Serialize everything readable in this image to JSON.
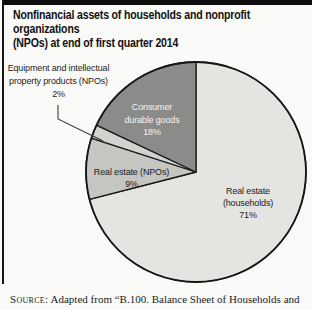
{
  "header": {
    "title_line1": "Nonfinancial assets of households and nonprofit organizations",
    "title_line2": "(NPOs) at end of first quarter 2014"
  },
  "labels": {
    "equipment": "Equipment and intellectual\nproperty products (NPOs)\n2%",
    "durables": "Consumer\ndurable goods\n18%",
    "npo_real_estate": "Real estate (NPOs)\n9%",
    "households": "Real estate\n(households)\n71%"
  },
  "source": {
    "label": "Source:",
    "text": "Adapted from “B.100. Balance Sheet of Households and"
  },
  "chart_data": {
    "type": "pie",
    "title": "Nonfinancial assets of households and nonprofit organizations (NPOs) at end of first quarter 2014",
    "start_angle_deg": 0,
    "direction": "clockwise",
    "outline_color": "#1a1a1a",
    "slices": [
      {
        "id": "real-estate-households",
        "label": "Real estate (households)",
        "value_pct": 71,
        "color": "#e4e4e1"
      },
      {
        "id": "real-estate-npos",
        "label": "Real estate (NPOs)",
        "value_pct": 9,
        "color": "#c5c5c2"
      },
      {
        "id": "equipment-ip-npos",
        "label": "Equipment and intellectual property products (NPOs)",
        "value_pct": 2,
        "color": "#d2d2cf"
      },
      {
        "id": "consumer-durable-goods",
        "label": "Consumer durable goods",
        "value_pct": 18,
        "color": "#8b8b89"
      }
    ]
  }
}
